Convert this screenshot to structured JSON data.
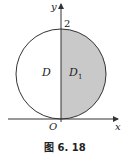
{
  "figure": {
    "caption": "图 6. 18",
    "axes": {
      "x_label": "x",
      "y_label": "y",
      "origin_label": "O",
      "y_tick": "2"
    },
    "regions": {
      "left": "D",
      "right_main": "D",
      "right_sub": "1"
    },
    "colors": {
      "shade": "#c9c9c9",
      "stroke": "#333333"
    }
  }
}
